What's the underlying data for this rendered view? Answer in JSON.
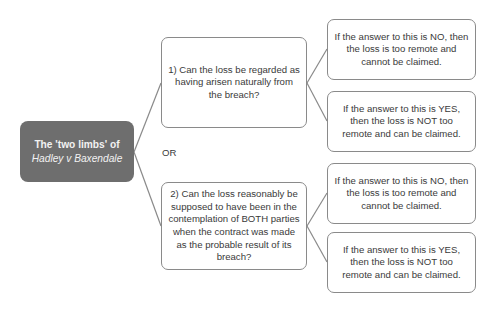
{
  "diagram": {
    "type": "tree",
    "root": {
      "line1": "The 'two limbs' of",
      "line2": "Hadley v Baxendale"
    },
    "connector_label": "OR",
    "limbs": [
      {
        "question": "1) Can the loss be regarded as having arisen naturally from the breach?",
        "outcomes": [
          "If the answer to this is NO, then the loss is too remote and cannot be claimed.",
          "If the answer to this is YES, then the loss is NOT too remote and can be claimed."
        ]
      },
      {
        "question": "2) Can the loss reasonably be supposed to have been in the contemplation of BOTH parties when the contract was made as the probable result of its breach?",
        "outcomes": [
          "If the answer to this is NO, then the loss is too remote and cannot be claimed.",
          "If the answer to this is YES, then the loss is NOT too remote and can be claimed."
        ]
      }
    ],
    "colors": {
      "root_fill": "#6e6e6e",
      "root_text": "#f2f2f2",
      "box_border": "#8a8a8a",
      "line": "#8a8a8a",
      "text": "#3a3a3a"
    }
  }
}
